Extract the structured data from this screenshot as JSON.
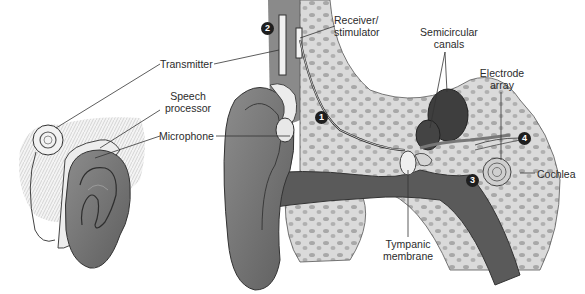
{
  "diagram": {
    "labels": {
      "transmitter": "Transmitter",
      "speech_processor_line1": "Speech",
      "speech_processor_line2": "processor",
      "microphone": "Microphone",
      "receiver_line1": "Receiver/",
      "receiver_line2": "stimulator",
      "semicircular_line1": "Semicircular",
      "semicircular_line2": "canals",
      "electrode_line1": "Electrode",
      "electrode_line2": "array",
      "cochlea": "Cochlea",
      "tympanic_line1": "Tympanic",
      "tympanic_line2": "membrane"
    },
    "markers": {
      "m1": "1",
      "m2": "2",
      "m3": "3",
      "m4": "4"
    },
    "colors": {
      "skin_dark": "#6e6e6e",
      "skin_mid": "#8a8a8a",
      "bone": "#d9d9d9",
      "bone_spots": "#a9a9a9",
      "canal_dark": "#4a4a4a",
      "device": "#eeeeee",
      "line": "#333333"
    }
  }
}
